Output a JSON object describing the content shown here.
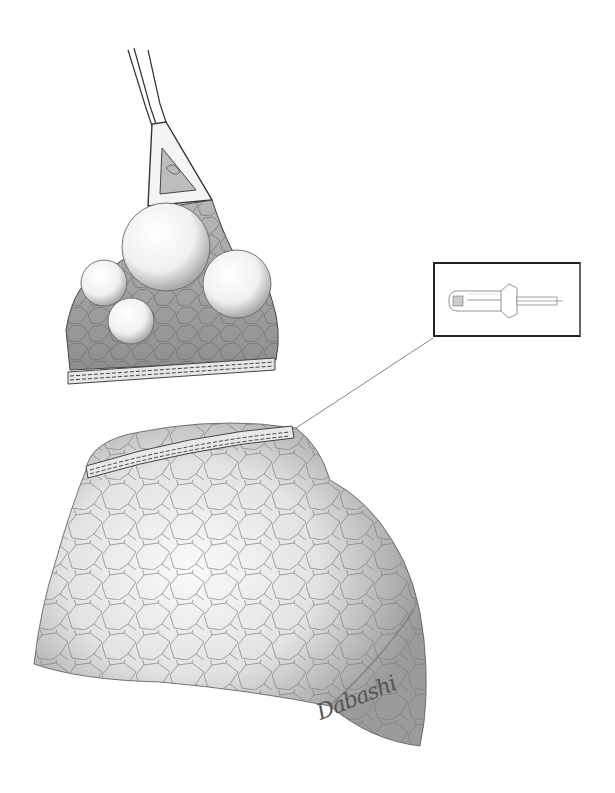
{
  "figure": {
    "signature": "Dabashi",
    "inset": {
      "subject": "linear-stapler"
    },
    "colors": {
      "background": "#ffffff",
      "ink": "#333333",
      "shade": "#9a9a9a",
      "light": "#eeeeee"
    }
  }
}
